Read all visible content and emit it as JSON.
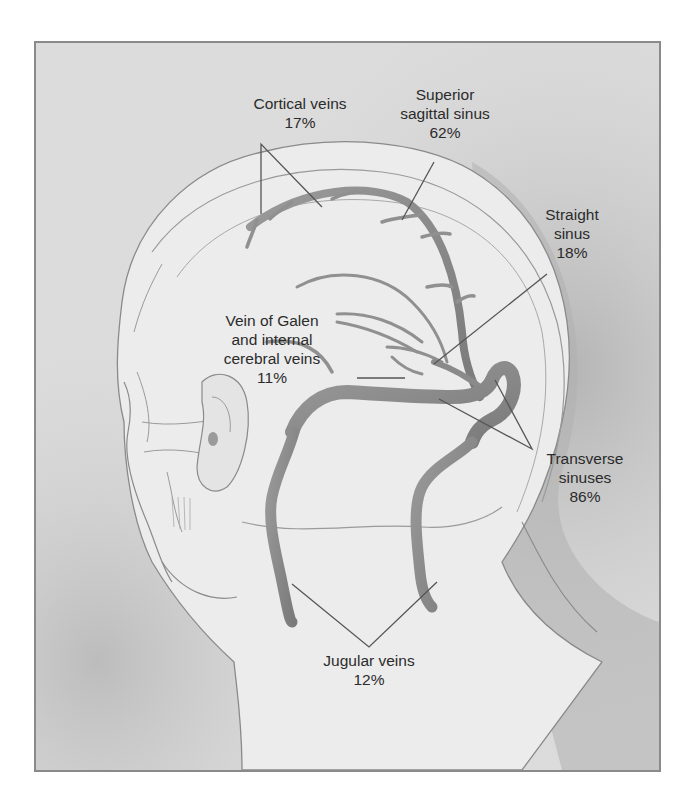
{
  "figure": {
    "colors": {
      "background": "#dcdcdc",
      "head_fill": "#ececec",
      "shadow": "#a8a8a8",
      "vein": "#8c8c8c",
      "outline": "#8a8a8a",
      "leader_line": "#555555",
      "text": "#2b2b2b"
    }
  },
  "labels": {
    "cortical_veins": {
      "line1": "Cortical veins",
      "percent": "17%"
    },
    "superior_sagittal_sinus": {
      "line1": "Superior",
      "line2": "sagittal sinus",
      "percent": "62%"
    },
    "straight_sinus": {
      "line1": "Straight",
      "line2": "sinus",
      "percent": "18%"
    },
    "vein_of_galen": {
      "line1": "Vein of Galen",
      "line2": "and internal",
      "line3": "cerebral veins",
      "percent": "11%"
    },
    "transverse_sinuses": {
      "line1": "Transverse",
      "line2": "sinuses",
      "percent": "86%"
    },
    "jugular_veins": {
      "line1": "Jugular veins",
      "percent": "12%"
    }
  }
}
